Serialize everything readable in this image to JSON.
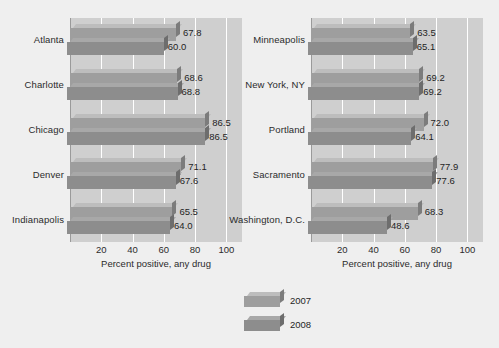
{
  "chart_data": {
    "type": "bar",
    "orientation": "horizontal",
    "title": "",
    "xlabel": "Percent positive, any drug",
    "ylabel": "",
    "xlim": [
      0,
      110
    ],
    "xticks": [
      20,
      40,
      60,
      80,
      100
    ],
    "grid": true,
    "legend_position": "bottom-center",
    "series": [
      {
        "name": "2007",
        "color": "#9e9e9e"
      },
      {
        "name": "2008",
        "color": "#8d8d8d"
      }
    ],
    "panels": [
      {
        "name": "left-panel",
        "categories": [
          "Atlanta",
          "Charlotte",
          "Chicago",
          "Denver",
          "Indianapolis"
        ],
        "series": [
          {
            "name": "2007",
            "values": [
              67.8,
              68.6,
              86.5,
              71.1,
              65.5
            ]
          },
          {
            "name": "2008",
            "values": [
              60.0,
              68.8,
              86.5,
              67.6,
              64.0
            ]
          }
        ],
        "value_labels": [
          {
            "category": "Atlanta",
            "2007": "67.8",
            "2008": "60.0"
          },
          {
            "category": "Charlotte",
            "2007": "68.6",
            "2008": "68.8"
          },
          {
            "category": "Chicago",
            "2007": "86.5",
            "2008": "86.5"
          },
          {
            "category": "Denver",
            "2007": "71.1",
            "2008": "67.6"
          },
          {
            "category": "Indianapolis",
            "2007": "65.5",
            "2008": "64.0"
          }
        ],
        "xlabel": "Percent positive, any drug",
        "xticks": [
          "20",
          "40",
          "60",
          "80",
          "100"
        ]
      },
      {
        "name": "right-panel",
        "categories": [
          "Minneapolis",
          "New York, NY",
          "Portland",
          "Sacramento",
          "Washington, D.C."
        ],
        "series": [
          {
            "name": "2007",
            "values": [
              63.5,
              69.2,
              72.0,
              77.9,
              68.3
            ]
          },
          {
            "name": "2008",
            "values": [
              65.1,
              69.2,
              64.1,
              77.6,
              48.6
            ]
          }
        ],
        "value_labels": [
          {
            "category": "Minneapolis",
            "2007": "63.5",
            "2008": "65.1"
          },
          {
            "category": "New York, NY",
            "2007": "69.2",
            "2008": "69.2"
          },
          {
            "category": "Portland",
            "2007": "72.0",
            "2008": "64.1"
          },
          {
            "category": "Sacramento",
            "2007": "77.9",
            "2008": "77.6"
          },
          {
            "category": "Washington, D.C.",
            "2007": "68.3",
            "2008": "48.6"
          }
        ],
        "xlabel": "Percent positive, any drug",
        "xticks": [
          "20",
          "40",
          "60",
          "80",
          "100"
        ]
      }
    ],
    "legend": [
      {
        "label": "2007"
      },
      {
        "label": "2008"
      }
    ]
  },
  "colors": {
    "background": "#efefef",
    "plot_background": "#cfcfcf",
    "gridline": "#ffffff",
    "bar_2007": "#9e9e9e",
    "bar_2008": "#8d8d8d",
    "text": "#1f1f1f"
  }
}
